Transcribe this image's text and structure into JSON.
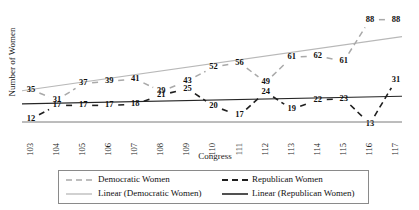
{
  "chart_data": {
    "type": "line",
    "title": "",
    "xlabel": "Congress",
    "ylabel": "Number of Women",
    "categories": [
      "103",
      "104",
      "105",
      "106",
      "107",
      "108",
      "109",
      "110",
      "111",
      "112",
      "113",
      "114",
      "115",
      "116",
      "117"
    ],
    "series": [
      {
        "name": "Democratic Women",
        "style": "dashed",
        "color": "#a9a9a9",
        "values": [
          35,
          31,
          37,
          39,
          41,
          39,
          43,
          52,
          56,
          49,
          61,
          62,
          61,
          88,
          88
        ]
      },
      {
        "name": "Republican Women",
        "style": "dashed",
        "color": "#1f1f1f",
        "values": [
          12,
          17,
          17,
          17,
          18,
          21,
          25,
          20,
          17,
          24,
          19,
          22,
          23,
          13,
          31
        ]
      }
    ],
    "trendlines": [
      {
        "name": "Linear (Democratic Women)",
        "style": "solid",
        "color": "#b8b8b8",
        "start_value": 28.5,
        "end_value": 78.0
      },
      {
        "name": "Linear (Republican Women)",
        "style": "solid",
        "color": "#262626",
        "start_value": 16.5,
        "end_value": 23.5
      }
    ],
    "ylim": [
      0,
      95
    ],
    "xlim": [
      103,
      117
    ],
    "grid": false,
    "y_axis_ticks_visible": false,
    "legend_position": "bottom",
    "legend_entries": [
      "Democratic Women",
      "Republican Women",
      "Linear (Democratic Women)",
      "Linear (Republican Women)"
    ]
  },
  "axes": {
    "y_title": "Number of Women",
    "x_title": "Congress"
  },
  "legend": {
    "entries": [
      {
        "label": "Democratic Women",
        "swatch": "dem-dash"
      },
      {
        "label": "Republican Women",
        "swatch": "rep-dash"
      },
      {
        "label": "Linear (Democratic Women)",
        "swatch": "dem-solid"
      },
      {
        "label": "Linear (Republican Women)",
        "swatch": "rep-solid"
      }
    ]
  }
}
